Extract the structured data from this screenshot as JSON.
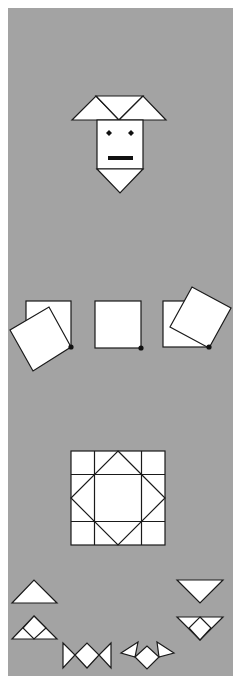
{
  "canvas": {
    "width": 240,
    "height": 687,
    "background": "#ffffff"
  },
  "panel": {
    "color": "#a3a3a3",
    "x": 8,
    "y": 8,
    "width": 225,
    "height": 668
  },
  "colors": {
    "fill": "#ffffff",
    "stroke": "#1a1a1a",
    "dot": "#111111"
  },
  "figures": [
    {
      "name": "goat-face",
      "description": "Square face with two triangular horns, diamond eyes, bar mouth and triangular chin",
      "horn_left": "72,120 96,96 119,120",
      "horn_middle": "96,96 143,96 119,120",
      "horn_right": "119,120 143,96 166,120",
      "face": {
        "x": 97,
        "y": 120,
        "width": 46,
        "height": 49
      },
      "chin": "97,169 143,169 120,193",
      "eye_left": "109,130 112,133 109,136 106,133",
      "eye_right": "131,130 134,133 131,136 128,133",
      "mouth": {
        "x": 108,
        "y": 156,
        "width": 25,
        "height": 4
      }
    },
    {
      "name": "rotating-squares",
      "description": "Three squares each pivoting about their bottom-right corner",
      "groups": [
        {
          "square": {
            "x": 26,
            "y": 301,
            "width": 45,
            "height": 46
          },
          "rotated": "71,347 49,307 10,330 33,371",
          "pivot": {
            "cx": 71,
            "cy": 347
          }
        },
        {
          "square": {
            "x": 95,
            "y": 301,
            "width": 46,
            "height": 47
          },
          "rotated": "",
          "pivot": {
            "cx": 141,
            "cy": 348
          }
        },
        {
          "square": {
            "x": 163,
            "y": 301,
            "width": 46,
            "height": 46
          },
          "rotated": "209,348 231,308 192,287 170,327",
          "pivot": {
            "cx": 209,
            "cy": 347
          }
        }
      ]
    },
    {
      "name": "grid-diamond",
      "description": "4x4 grid of squares with an inscribed diamond",
      "grid": {
        "x": 71,
        "y": 451,
        "size": 94,
        "cells": 4
      },
      "diamond": "118,451 165,498 118,545 71,498"
    },
    {
      "name": "triangle-pieces",
      "items": [
        {
          "label": "triangle-up",
          "outline": "12,603 34,580 57,603",
          "inner": []
        },
        {
          "label": "triangle-up-split",
          "outline": "12,639 34,616 57,639",
          "inner": [
            "23,628 34,639 46,628",
            "23,628 34,616 46,628"
          ]
        },
        {
          "label": "triangle-down",
          "outline": "177,580 223,580 200,603",
          "inner": []
        },
        {
          "label": "triangle-down-split",
          "outline": "177,617 223,617 200,640",
          "inner": [
            "189,628 200,617 211,628",
            "189,628 200,640 211,628"
          ]
        },
        {
          "label": "bowtie",
          "outline": "",
          "inner": [
            "63,643 75,655 63,668",
            "75,655 87,643 99,655 87,668",
            "111,643 99,655 111,668"
          ]
        },
        {
          "label": "bat",
          "outline": "",
          "inner": [
            "121,653 138,642 135,657",
            "135,657 147,646 159,657 147,669",
            "157,642 174,653 159,657"
          ]
        }
      ]
    }
  ]
}
